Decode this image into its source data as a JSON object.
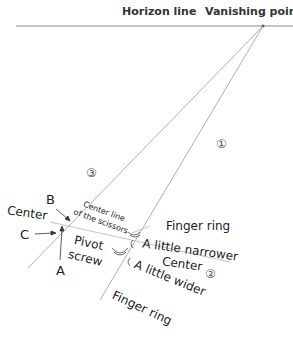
{
  "labels": {
    "horizon_line": "Horizon line",
    "vanishing_point": "Vanishing point",
    "step1": "①",
    "step2": "②",
    "step3": "③",
    "B": "B",
    "C": "C",
    "A": "A",
    "center_left": "Center",
    "center_line_1": "Center line",
    "center_line_2": "of the scissors",
    "pivot": "Pivot",
    "screw": "screw",
    "finger_ring_top": "Finger ring",
    "a_little_narrower": "A little narrower",
    "center_right": "Center",
    "a_little_wider": "A little wider",
    "finger_ring_bottom": "Finger ring"
  },
  "colors": {
    "line": "#9a9a9a",
    "horizon": "#8a8a8a",
    "text": "#222222"
  }
}
